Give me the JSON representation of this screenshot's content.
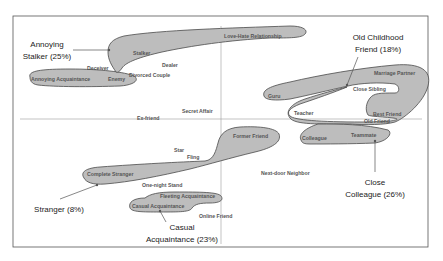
{
  "diagram": {
    "type": "relationship-map",
    "colors": {
      "cluster_fill": "#bdbdbd",
      "cluster_stroke": "#4a4a4a",
      "axis": "#9a9a9a",
      "text": "#555555",
      "label": "#222222"
    },
    "clusters": [
      {
        "id": "annoying-stalker",
        "label_line1": "Annoying",
        "label_line2": "Stalker (25%)",
        "percent": 25,
        "members": [
          "Annoying Acquaintance",
          "Enemy",
          "Stalker",
          "Love-Hate Relationship"
        ]
      },
      {
        "id": "old-childhood-friend",
        "label_line1": "Old Childhood",
        "label_line2": "Friend (18%)",
        "percent": 18,
        "members": [
          "Guru",
          "Teacher",
          "Close Sibling",
          "Best Friend",
          "Old Friend",
          "Marriage Partner"
        ]
      },
      {
        "id": "close-colleague",
        "label_line1": "Close",
        "label_line2": "Colleague (26%)",
        "percent": 26,
        "members": [
          "Colleague",
          "Teammate"
        ]
      },
      {
        "id": "stranger",
        "label_line1": "Stranger (8%)",
        "percent": 8,
        "members": [
          "Complete Stranger",
          "Former Friend"
        ]
      },
      {
        "id": "casual-acquaintance",
        "label_line1": "Casual",
        "label_line2": "Acquaintance (23%)",
        "percent": 23,
        "members": [
          "Casual Acquaintance",
          "Fleeting Acquaintance"
        ]
      }
    ],
    "terms": {
      "love_hate": "Love-Hate Relationship",
      "stalker": "Stalker",
      "deceiver": "Deceiver",
      "dealer": "Dealer",
      "divorced_couple": "Divorced Couple",
      "annoying_acquaintance": "Annoying Acquaintance",
      "enemy": "Enemy",
      "secret_affair": "Secret Affair",
      "ex_friend": "Ex-friend",
      "marriage_partner": "Marriage Partner",
      "close_sibling": "Close Sibling",
      "guru": "Guru",
      "teacher": "Teacher",
      "best_friend": "Best Friend",
      "old_friend": "Old Friend",
      "colleague": "Colleague",
      "teammate": "Teammate",
      "former_friend": "Former Friend",
      "star": "Star",
      "fling": "Fling",
      "complete_stranger": "Complete Stranger",
      "next_door_neighbor": "Next-door Neighbor",
      "one_night_stand": "One-night Stand",
      "fleeting_acquaintance": "Fleeting Acquaintance",
      "casual_acquaintance": "Casual Acquaintance",
      "online_friend": "Online Friend"
    }
  }
}
